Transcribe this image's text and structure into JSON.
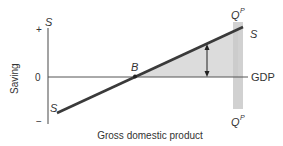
{
  "diagram": {
    "y_axis_label": "Saving",
    "x_axis_label": "Gross domestic product",
    "zero_line_label": "GDP",
    "tick_plus": "+",
    "tick_zero": "0",
    "tick_minus": "−",
    "curve_label_top": "S",
    "curve_label_bottom": "S",
    "axis_top_label": "S",
    "point_label": "B",
    "potential_output_top": "Q",
    "potential_output_top_sup": "P",
    "potential_output_bottom": "Q",
    "potential_output_bottom_sup": "P",
    "colors": {
      "line": "#3a3a3a",
      "axis": "#555555",
      "shade": "#d9d9d9",
      "band": "#c8c8c8",
      "text": "#333333"
    }
  }
}
